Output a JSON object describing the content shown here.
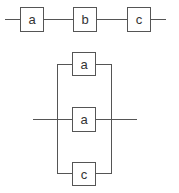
{
  "diagram": {
    "type": "reliability-block-diagram",
    "series_system": {
      "blocks": [
        {
          "label": "a"
        },
        {
          "label": "b"
        },
        {
          "label": "c"
        }
      ]
    },
    "parallel_system": {
      "blocks": [
        {
          "label": "a"
        },
        {
          "label": "a"
        },
        {
          "label": "c"
        }
      ]
    },
    "colors": {
      "line": "#555555",
      "box_fill": "#ffffff",
      "text": "#333333"
    }
  }
}
